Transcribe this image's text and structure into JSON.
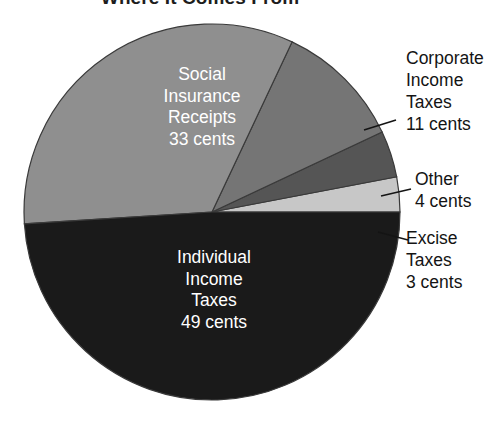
{
  "chart_data": {
    "type": "pie",
    "title": "Where It Comes From",
    "unit": "cents",
    "total": 100,
    "categories": [
      "Individual Income Taxes",
      "Social Insurance Receipts",
      "Corporate Income Taxes",
      "Other",
      "Excise Taxes"
    ],
    "values": [
      49,
      33,
      11,
      4,
      3
    ],
    "labels": [
      "Individual\nIncome\nTaxes\n49 cents",
      "Social\nInsurance\nReceipts\n33 cents",
      "Corporate\nIncome\nTaxes\n11 cents",
      "Other\n4 cents",
      "Excise\nTaxes\n3 cents"
    ],
    "colors": [
      "#1a1a1a",
      "#8f8f8f",
      "#757575",
      "#555555",
      "#c7c7c7"
    ],
    "label_colors": [
      "#ffffff",
      "#ffffff",
      "#141414",
      "#141414",
      "#141414"
    ],
    "label_placement": [
      "inside",
      "inside",
      "outside",
      "outside",
      "outside"
    ],
    "legend": "none",
    "grid": false,
    "start_angle_deg": 0,
    "direction": "counterclockwise"
  },
  "pie": {
    "center_x": 212,
    "center_y": 212,
    "radius": 188,
    "outline_color": "#3a3a3a",
    "slices": [
      {
        "name": "excise-taxes",
        "value": 3,
        "color": "#c7c7c7",
        "start_deg": 0,
        "end_deg": 10.8
      },
      {
        "name": "other",
        "value": 4,
        "color": "#555555",
        "start_deg": 10.8,
        "end_deg": 25.2
      },
      {
        "name": "corporate-income-taxes",
        "value": 11,
        "color": "#757575",
        "start_deg": 25.2,
        "end_deg": 64.8
      },
      {
        "name": "social-insurance-receipts",
        "value": 33,
        "color": "#8f8f8f",
        "start_deg": 64.8,
        "end_deg": 183.6
      },
      {
        "name": "individual-income-taxes",
        "value": 49,
        "color": "#1a1a1a",
        "start_deg": 183.6,
        "end_deg": 360
      }
    ]
  },
  "labels": {
    "title": "Where It Comes From",
    "social_insurance": "Social\nInsurance\nReceipts\n33 cents",
    "individual_income": "Individual\nIncome\nTaxes\n49 cents",
    "corporate_income": "Corporate\nIncome\nTaxes\n11 cents",
    "other": "Other\n4 cents",
    "excise_taxes": "Excise\nTaxes\n3 cents"
  },
  "leader_lines": {
    "color": "#141414",
    "lines": [
      {
        "name": "leader-corporate",
        "x1": 364,
        "y1": 130,
        "x2": 396,
        "y2": 120
      },
      {
        "name": "leader-other",
        "x1": 381,
        "y1": 196,
        "x2": 411,
        "y2": 189
      },
      {
        "name": "leader-excise",
        "x1": 378,
        "y1": 232,
        "x2": 408,
        "y2": 240
      }
    ]
  }
}
